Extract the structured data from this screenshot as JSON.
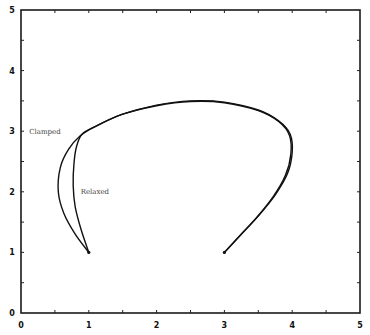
{
  "chart_data": {
    "type": "line",
    "title": "",
    "xlabel": "",
    "ylabel": "",
    "xlim": [
      0,
      5
    ],
    "ylim": [
      0,
      5
    ],
    "grid": false,
    "legend": "none (inline annotations)",
    "x_ticks": [
      "0",
      "1",
      "2",
      "3",
      "4",
      "5"
    ],
    "y_ticks": [
      "0",
      "1",
      "2",
      "3",
      "4",
      "5"
    ],
    "minor_tick_step": 0.5,
    "annotations": [
      {
        "text": "Clamped",
        "x": 0.12,
        "y": 2.95
      },
      {
        "text": "Relaxed",
        "x": 0.88,
        "y": 1.97
      }
    ],
    "series": [
      {
        "name": "Clamped",
        "points": [
          [
            1.0,
            1.0
          ],
          [
            0.8,
            1.3
          ],
          [
            0.63,
            1.65
          ],
          [
            0.55,
            2.0
          ],
          [
            0.58,
            2.4
          ],
          [
            0.7,
            2.7
          ],
          [
            0.87,
            2.92
          ],
          [
            1.1,
            3.08
          ],
          [
            1.5,
            3.28
          ],
          [
            2.0,
            3.43
          ],
          [
            2.5,
            3.5
          ],
          [
            3.0,
            3.48
          ],
          [
            3.5,
            3.35
          ],
          [
            3.8,
            3.17
          ],
          [
            3.97,
            2.95
          ],
          [
            4.0,
            2.65
          ],
          [
            3.93,
            2.3
          ],
          [
            3.75,
            1.95
          ],
          [
            3.5,
            1.6
          ],
          [
            3.25,
            1.3
          ],
          [
            3.0,
            1.0
          ]
        ]
      },
      {
        "name": "Relaxed",
        "points": [
          [
            1.0,
            1.0
          ],
          [
            0.88,
            1.4
          ],
          [
            0.8,
            1.75
          ],
          [
            0.77,
            2.1
          ],
          [
            0.78,
            2.45
          ],
          [
            0.82,
            2.75
          ],
          [
            0.9,
            2.95
          ],
          [
            1.1,
            3.08
          ],
          [
            1.5,
            3.28
          ],
          [
            2.0,
            3.42
          ],
          [
            2.5,
            3.49
          ],
          [
            3.0,
            3.47
          ],
          [
            3.5,
            3.34
          ],
          [
            3.8,
            3.16
          ],
          [
            3.96,
            2.93
          ],
          [
            3.98,
            2.62
          ],
          [
            3.9,
            2.27
          ],
          [
            3.72,
            1.92
          ],
          [
            3.47,
            1.57
          ],
          [
            3.23,
            1.28
          ],
          [
            3.0,
            1.0
          ]
        ]
      }
    ]
  }
}
